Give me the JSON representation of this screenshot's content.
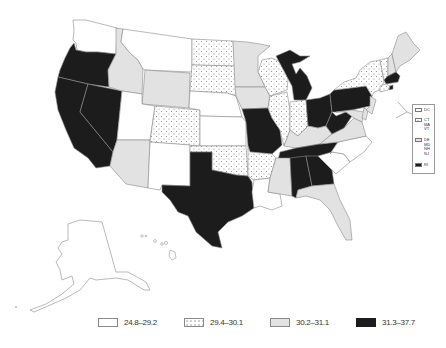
{
  "map": {
    "title": "",
    "type": "choropleth",
    "region": "United States",
    "legend": [
      {
        "range": "24.8–29.2",
        "style": "white",
        "color": "#ffffff"
      },
      {
        "range": "29.4–30.1",
        "style": "dotted",
        "color": "#ffffff"
      },
      {
        "range": "30.2–31.1",
        "style": "light-gray",
        "color": "#e2e2e2"
      },
      {
        "range": "31.3–37.7",
        "style": "black",
        "color": "#1c1c1c"
      }
    ],
    "inset_legend": [
      {
        "label": "DC",
        "style": "white"
      },
      {
        "label": "CT MA VT",
        "style": "dotted"
      },
      {
        "label": "DE MD NH NJ",
        "style": "light-gray"
      },
      {
        "label": "RI",
        "style": "black"
      }
    ],
    "states": {
      "WA": "white",
      "OR": "black",
      "CA": "black",
      "NV": "black",
      "ID": "light-gray",
      "MT": "white",
      "WY": "light-gray",
      "UT": "white",
      "AZ": "light-gray",
      "CO": "dotted",
      "NM": "white",
      "ND": "dotted",
      "SD": "dotted",
      "NE": "white",
      "KS": "white",
      "OK": "dotted",
      "TX": "black",
      "MN": "light-gray",
      "IA": "light-gray",
      "MO": "black",
      "AR": "dotted",
      "LA": "white",
      "WI": "dotted",
      "IL": "dotted",
      "MI": "black",
      "IN": "dotted",
      "OH": "black",
      "KY": "light-gray",
      "TN": "black",
      "MS": "light-gray",
      "AL": "black",
      "GA": "black",
      "FL": "light-gray",
      "SC": "white",
      "NC": "white",
      "VA": "light-gray",
      "WV": "black",
      "PA": "black",
      "NY": "dotted",
      "ME": "light-gray",
      "AK": "white",
      "HI": "white"
    }
  },
  "legend_labels": {
    "l0": "24.8–29.2",
    "l1": "29.4–30.1",
    "l2": "30.2–31.1",
    "l3": "31.3–37.7"
  },
  "inset_labels": {
    "i0": "DC",
    "i1": "CT MA VT",
    "i2": "DE MD NH NJ",
    "i3": "RI"
  }
}
